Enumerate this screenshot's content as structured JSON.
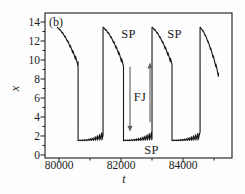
{
  "figure": {
    "panel_label": "(b)",
    "background": "#fdfdfd",
    "ink_color": "#1c1c1c",
    "curve_color": "#161616",
    "arrow_color": "#606060"
  },
  "chart_data": {
    "type": "line",
    "title": "",
    "xlabel": "t",
    "ylabel": "x",
    "xlim": [
      79548,
      85580
    ],
    "ylim": [
      -0.32,
      14.95
    ],
    "grid": false,
    "legend": false,
    "x_ticks": [
      {
        "t": 80000,
        "label": "80000"
      },
      {
        "t": 82000,
        "label": "82000"
      },
      {
        "t": 84000,
        "label": "84000"
      }
    ],
    "x_minor_ticks": [
      81000,
      83000,
      85000
    ],
    "y_ticks": [
      {
        "v": 0,
        "label": "0"
      },
      {
        "v": 2,
        "label": "2"
      },
      {
        "v": 4,
        "label": "4"
      },
      {
        "v": 6,
        "label": "6"
      },
      {
        "v": 8,
        "label": "8"
      },
      {
        "v": 10,
        "label": "10"
      },
      {
        "v": 12,
        "label": "12"
      },
      {
        "v": 14,
        "label": "14"
      }
    ],
    "y_minor_ticks": [
      1,
      3,
      5,
      7,
      9,
      11,
      13
    ],
    "annotations": [
      {
        "id": "sp-top-1",
        "text": "SP",
        "t": 82240,
        "v": 12.75
      },
      {
        "id": "sp-top-2",
        "text": "SP",
        "t": 83725,
        "v": 12.75
      },
      {
        "id": "sp-bottom",
        "text": "SP",
        "t": 82985,
        "v": 0.55
      },
      {
        "id": "fj-label",
        "text": "FJ",
        "t": 82610,
        "v": 6.1
      }
    ],
    "arrows": [
      {
        "id": "fj-down-arrow",
        "direction": "down",
        "t": 82290,
        "v_tail": 9.3,
        "v_tip": 2.45
      },
      {
        "id": "fj-up-arrow",
        "direction": "up",
        "t": 82935,
        "v_tail": 3.45,
        "v_tip": 9.75
      }
    ],
    "series": [
      {
        "name": "x(t)",
        "description": "Relaxation oscillation: slow stepped decay from ~13.4 to ~9.5 (SP), fast drop to ~1.5, slow oscillatory growth to ~2.5 (SP), fast jump back up (FJ)",
        "style": {
          "color": "#161616",
          "width": 1.1
        },
        "waveform": {
          "v_peak": 13.4,
          "high_decay_exponent": 1.45,
          "v_at_drop": [
            9.55,
            9.45,
            9.55
          ],
          "phase_starts": [
            79935,
            81420,
            83000,
            84550
          ],
          "drop_times": [
            80615,
            82080,
            83645
          ],
          "t_end": 85145,
          "v_end": 8.4,
          "low_v_bottom": 1.5,
          "low_v_top_at_jump": 2.55,
          "high_ripple": {
            "period": 85,
            "amp_start": 0.1,
            "amp_end": 0.5
          },
          "low_ripple": {
            "period": 70,
            "amp_start": 0.08,
            "amp_end": 0.9
          }
        }
      }
    ]
  }
}
